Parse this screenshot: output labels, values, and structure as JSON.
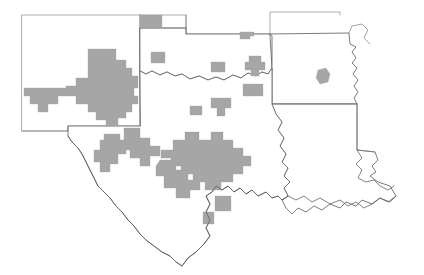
{
  "map": {
    "title": "County-level shaded map of the south-central United States",
    "description": "Outline map of New Mexico, Texas, Oklahoma, Arkansas and Louisiana with neighboring state edges; selected counties are filled in gray.",
    "projection_note": "Unlabeled outline map, no legend, no scale bar, no axis labels",
    "background_color": "#ffffff",
    "shaded_fill_color": "#a6a6a6",
    "outline_color": "#5a5a5a",
    "internal_border_color": "#7d7d7d",
    "legend": null,
    "scale_bar": null,
    "north_arrow": null,
    "labels": [],
    "states": [
      {
        "id": "new-mexico",
        "name": "New Mexico",
        "outline_style": "soft"
      },
      {
        "id": "texas",
        "name": "Texas",
        "outline_style": "strong"
      },
      {
        "id": "oklahoma",
        "name": "Oklahoma",
        "outline_style": "strong"
      },
      {
        "id": "arkansas",
        "name": "Arkansas",
        "outline_style": "strong"
      },
      {
        "id": "louisiana",
        "name": "Louisiana",
        "outline_style": "strong"
      },
      {
        "id": "colorado-edge",
        "name": "Colorado",
        "outline_style": "soft"
      },
      {
        "id": "kansas-edge",
        "name": "Kansas",
        "outline_style": "soft"
      },
      {
        "id": "missouri-edge",
        "name": "Missouri",
        "outline_style": "soft"
      },
      {
        "id": "mississippi-edge",
        "name": "Mississippi",
        "outline_style": "soft"
      }
    ],
    "shaded_regions": [
      {
        "id": "nm-southwest-block",
        "state": "New Mexico",
        "kind": "large-contiguous-block"
      },
      {
        "id": "nm-west-arm",
        "state": "New Mexico",
        "kind": "contiguous-arm"
      },
      {
        "id": "ok-panhandle-square",
        "state": "Oklahoma",
        "kind": "single-county"
      },
      {
        "id": "tx-panhandle-square",
        "state": "Texas",
        "kind": "single-county"
      },
      {
        "id": "ok-north-central",
        "state": "Oklahoma",
        "kind": "small-cluster"
      },
      {
        "id": "ok-west-small",
        "state": "Oklahoma",
        "kind": "single-county"
      },
      {
        "id": "ok-central-cluster",
        "state": "Oklahoma",
        "kind": "small-cluster"
      },
      {
        "id": "ok-south-block",
        "state": "Oklahoma",
        "kind": "single-county"
      },
      {
        "id": "ar-southwest-county",
        "state": "Arkansas",
        "kind": "single-county"
      },
      {
        "id": "tx-north-central-pair",
        "state": "Texas",
        "kind": "small-cluster"
      },
      {
        "id": "tx-north-small",
        "state": "Texas",
        "kind": "single-county"
      },
      {
        "id": "tx-central-mass",
        "state": "Texas",
        "kind": "large-contiguous-block"
      },
      {
        "id": "tx-west-mass",
        "state": "Texas",
        "kind": "large-contiguous-block"
      },
      {
        "id": "tx-bigbend-block",
        "state": "Texas",
        "kind": "contiguous-block"
      },
      {
        "id": "tx-southwest-strip",
        "state": "Texas",
        "kind": "contiguous-strip"
      },
      {
        "id": "tx-south-county-a",
        "state": "Texas",
        "kind": "single-county"
      },
      {
        "id": "tx-south-county-b",
        "state": "Texas",
        "kind": "single-county"
      }
    ],
    "counts": {
      "states_drawn": 9,
      "shaded_region_groups": 17
    }
  }
}
